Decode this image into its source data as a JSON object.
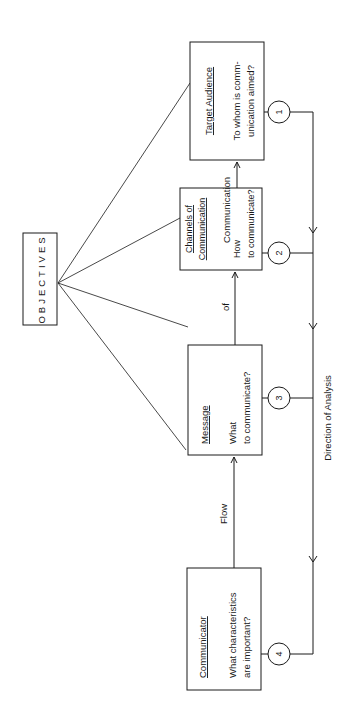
{
  "diagram": {
    "type": "communication-analysis-flow",
    "orientation": "rotated-90-ccw",
    "root": {
      "label": "OBJECTIVES"
    },
    "nodes": [
      {
        "id": "communicator",
        "title": "Communicator",
        "question_line1": "What characteristics",
        "question_line2": "are important?",
        "step": "4"
      },
      {
        "id": "message",
        "title": "Message",
        "question_line1": "What",
        "question_line2": "to communicate?",
        "step": "3"
      },
      {
        "id": "channels",
        "title_line1": "Channels of",
        "title_line2": "Communication",
        "question_line1": "How",
        "question_line2": "to communicate?",
        "step": "2"
      },
      {
        "id": "target-audience",
        "title": "Target Audience",
        "question_line1": "To whom is comm-",
        "question_line2": "unication aimed?",
        "step": "1"
      }
    ],
    "flow_labels": [
      "Flow",
      "of",
      "Communication"
    ],
    "analysis_label": "Direction of Analysis",
    "colors": {
      "ink": "#1a1a1a",
      "background": "#ffffff"
    }
  }
}
